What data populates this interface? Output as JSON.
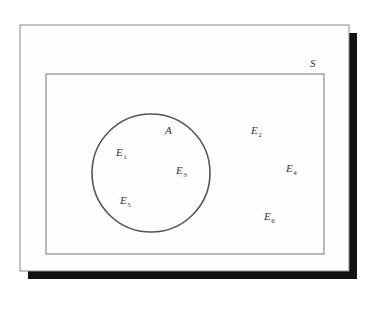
{
  "diagram": {
    "type": "venn-diagram",
    "colors": {
      "background": "#ffffff",
      "frame_fill": "#fefefe",
      "frame_stroke": "#8a8a8a",
      "shadow": "#111111",
      "set_stroke": "#555555",
      "text": "#333333"
    },
    "frame": {
      "x": 20,
      "y": 25,
      "width": 329,
      "height": 246,
      "shadow_offset": 8
    },
    "sample_space": {
      "label": "S",
      "rect": {
        "x": 46,
        "y": 74,
        "width": 278,
        "height": 180
      },
      "label_pos": {
        "x": 310,
        "y": 67
      }
    },
    "event_set": {
      "label": "A",
      "circle": {
        "cx": 151,
        "cy": 173,
        "r": 59
      },
      "label_pos": {
        "x": 165,
        "y": 134
      }
    },
    "outcomes": [
      {
        "base": "E",
        "sub": "1",
        "x": 116,
        "y": 156,
        "in_A": true
      },
      {
        "base": "E",
        "sub": "2",
        "x": 251,
        "y": 134,
        "in_A": false
      },
      {
        "base": "E",
        "sub": "3",
        "x": 176,
        "y": 174,
        "in_A": true
      },
      {
        "base": "E",
        "sub": "4",
        "x": 286,
        "y": 172,
        "in_A": false
      },
      {
        "base": "E",
        "sub": "5",
        "x": 120,
        "y": 204,
        "in_A": true
      },
      {
        "base": "E",
        "sub": "6",
        "x": 264,
        "y": 220,
        "in_A": false
      }
    ]
  }
}
